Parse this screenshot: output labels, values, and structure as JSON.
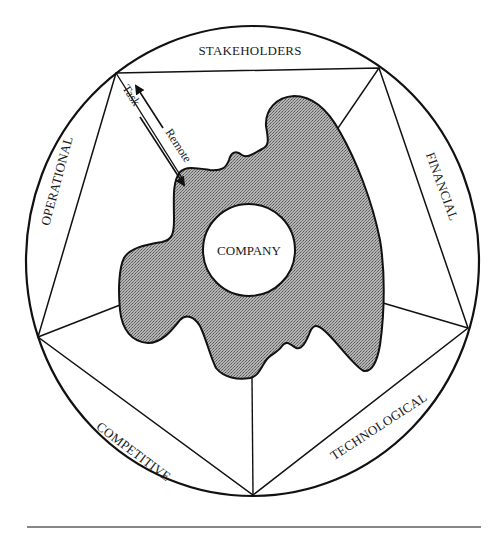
{
  "diagram": {
    "type": "environment-pentagon",
    "center_label": "COMPANY",
    "environment_segments": [
      {
        "id": "stakeholders",
        "label": "STAKEHOLDERS"
      },
      {
        "id": "financial",
        "label": "FINANCIAL"
      },
      {
        "id": "technological",
        "label": "TECHNOLOGICAL"
      },
      {
        "id": "competitive",
        "label": "COMPETITIVE"
      },
      {
        "id": "operational",
        "label": "OPERATIONAL"
      }
    ],
    "arrows": {
      "inward": {
        "label": "Task",
        "direction": "toward company"
      },
      "outward": {
        "label": "Remote",
        "direction": "toward environment"
      }
    },
    "colors": {
      "line": "#111111",
      "blob_fill": "#9a9a9a",
      "background": "#ffffff"
    }
  }
}
